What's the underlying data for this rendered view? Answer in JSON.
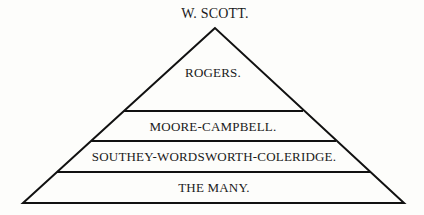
{
  "diagram": {
    "type": "pyramid",
    "apex_label": "W. SCOTT.",
    "tiers": [
      {
        "label": "ROGERS."
      },
      {
        "label": "MOORE-CAMPBELL."
      },
      {
        "label": "SOUTHEY-WORDSWORTH-COLERIDGE."
      },
      {
        "label": "THE MANY."
      }
    ],
    "line_color": "#111111",
    "text_color": "#1a1a1a"
  }
}
